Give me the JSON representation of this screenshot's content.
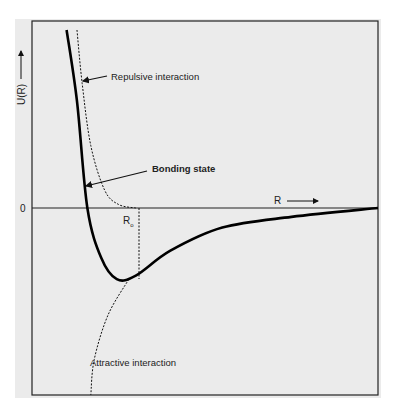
{
  "chart_data": {
    "type": "line",
    "title": "",
    "xlabel": "R",
    "ylabel": "U(R)",
    "y_zero_label": "0",
    "equilibrium_label": "R",
    "equilibrium_subscript": "o",
    "grid": false,
    "annotations": [
      {
        "text": "Repulsive interaction",
        "points_to": "repulsive-curve"
      },
      {
        "text": "Bonding state",
        "points_to": "bonding-curve"
      },
      {
        "text": "Attractive interaction",
        "points_to": "attractive-curve"
      }
    ],
    "series": [
      {
        "name": "Bonding state",
        "style": "solid-thick",
        "points": [
          [
            0.1,
            1.0
          ],
          [
            0.13,
            0.6
          ],
          [
            0.16,
            0.0
          ],
          [
            0.2,
            -0.28
          ],
          [
            0.245,
            -0.4
          ],
          [
            0.3,
            -0.38
          ],
          [
            0.4,
            -0.24
          ],
          [
            0.55,
            -0.11
          ],
          [
            0.75,
            -0.05
          ],
          [
            1.0,
            0.0
          ]
        ]
      },
      {
        "name": "Repulsive interaction",
        "style": "dashed",
        "points": [
          [
            0.13,
            1.0
          ],
          [
            0.145,
            0.7
          ],
          [
            0.17,
            0.35
          ],
          [
            0.21,
            0.1
          ],
          [
            0.25,
            0.02
          ],
          [
            0.3,
            0.0
          ]
        ]
      },
      {
        "name": "Attractive interaction",
        "style": "dashed",
        "points": [
          [
            0.28,
            -0.4
          ],
          [
            0.22,
            -0.6
          ],
          [
            0.18,
            -0.85
          ],
          [
            0.17,
            -1.05
          ]
        ]
      }
    ]
  }
}
